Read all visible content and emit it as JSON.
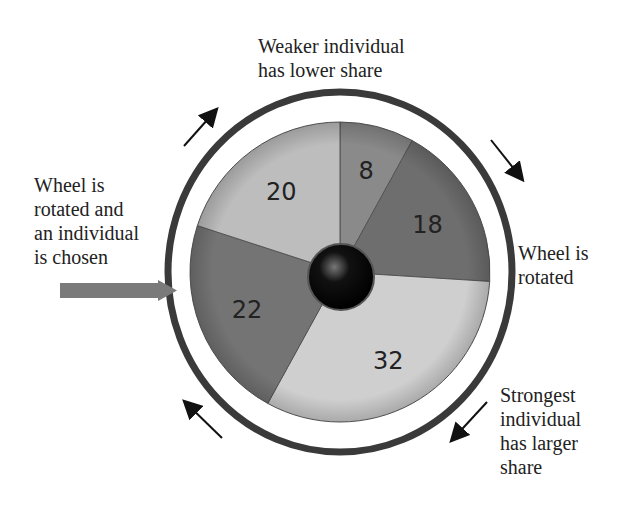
{
  "labels": {
    "top": "Weaker individual\nhas lower share",
    "left": "Wheel is\nrotated and\nan individual\nis chosen",
    "right": "Wheel is\nrotated",
    "bottom_right": "Strongest\nindividual\nhas larger\nshare"
  },
  "chart_data": {
    "type": "pie",
    "categories": [
      "8",
      "18",
      "32",
      "22",
      "20"
    ],
    "values": [
      8,
      18,
      32,
      22,
      20
    ],
    "colors": [
      "#8a8a8a",
      "#6e6e6e",
      "#cfcfcf",
      "#747474",
      "#bdbdbd"
    ],
    "start_angle_deg": 0,
    "direction": "clockwise"
  },
  "colors": {
    "ring": "#3a3a3a",
    "pointer": "#7a7a7a",
    "hub": "#111111"
  }
}
